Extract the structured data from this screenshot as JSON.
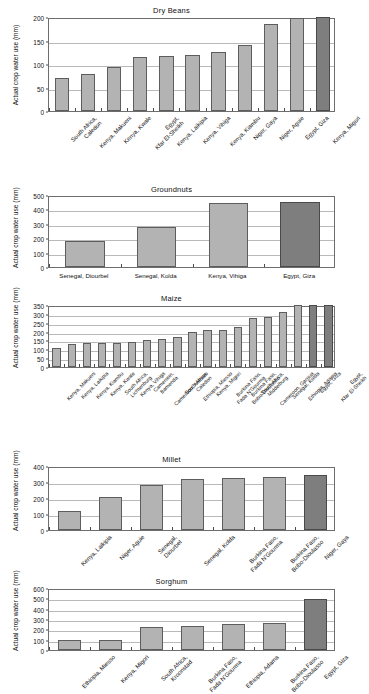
{
  "figure": {
    "ylabel": "Actual crop water use (mm)",
    "colors": {
      "bar": "#b3b3b3",
      "bar_highlight": "#7e7e7e",
      "axis": "#6d6d6d",
      "grid": "#b9b9b9"
    }
  },
  "chart_data": [
    {
      "type": "bar",
      "title": "Dry Beans",
      "xlabel": "",
      "ylabel": "Actual crop water use (mm)",
      "ylim": [
        0,
        200
      ],
      "yticks": [
        0,
        50,
        100,
        150,
        200
      ],
      "grid": true,
      "legend": "none",
      "categories": [
        "South Africa, Caledon",
        "Kenya, Makueni",
        "Kenya, Kwale",
        "Egypt, Kfar El-Sheikh",
        "Kenya, Laikipia",
        "Kenya, Vihiga",
        "Kenya, Kiambu",
        "Niger, Gaya",
        "Niger, Aguie",
        "Egypt, Giza",
        "Kenya, Migori"
      ],
      "values": [
        70,
        79,
        94,
        114,
        117,
        119,
        126,
        140,
        186,
        198,
        200
      ],
      "highlighted": [
        10
      ]
    },
    {
      "type": "bar",
      "title": "Groundnuts",
      "xlabel": "",
      "ylabel": "Actual crop water use (mm)",
      "ylim": [
        0,
        500
      ],
      "yticks": [
        0,
        100,
        200,
        300,
        400,
        500
      ],
      "grid": true,
      "legend": "none",
      "categories": [
        "Senegal, Diourbel",
        "Senegal, Kolda",
        "Kenya, Vihiga",
        "Egypt, Giza"
      ],
      "values": [
        180,
        281,
        444,
        451
      ],
      "highlighted": [
        3
      ]
    },
    {
      "type": "bar",
      "title": "Maize",
      "xlabel": "",
      "ylabel": "Actual crop water use (mm)",
      "ylim": [
        0,
        350
      ],
      "yticks": [
        0,
        50,
        100,
        150,
        200,
        250,
        300,
        350
      ],
      "grid": true,
      "legend": "none",
      "categories": [
        "Kenya, Makueni",
        "Kenya, Laikipia",
        "Kenya, Kiambu",
        "Kenya, Kwale",
        "South Africa, Lichtenburg",
        "Kenya, Vihiga",
        "Cameroon, Bamenda",
        "Cameroon, Ambam",
        "South Africa, Caledon",
        "Ethiopia, Miesso",
        "Kenya, Migori",
        "Burkina Faso, Fada N'Gourma",
        "Burkina Faso, Bobo-Dioulasso",
        "South Africa, Middelburg",
        "Cameroon, Garoua",
        "Senegal, Kolda",
        "Ethiopia, Adama",
        "Egypt, Giza",
        "Egypt, Kfar El-Sheikh"
      ],
      "values": [
        110,
        130,
        134,
        136,
        137,
        139,
        152,
        157,
        167,
        197,
        211,
        211,
        228,
        276,
        285,
        310,
        350,
        350,
        350
      ],
      "highlighted": [
        17,
        18
      ]
    },
    {
      "type": "bar",
      "title": "Millet",
      "xlabel": "",
      "ylabel": "Actual crop water use (mm)",
      "ylim": [
        0,
        400
      ],
      "yticks": [
        0,
        100,
        200,
        300,
        400
      ],
      "grid": true,
      "legend": "none",
      "categories": [
        "Kenya, Laikipia",
        "Niger, Aguie",
        "Senegal, Diourbel",
        "Senegal, Kolda",
        "Burkina Faso, Fada N'Gourma",
        "Burkina Faso, Bobo-Dioulasso",
        "Niger, Gaya"
      ],
      "values": [
        118,
        208,
        282,
        318,
        325,
        330,
        345
      ],
      "highlighted": [
        6
      ]
    },
    {
      "type": "bar",
      "title": "Sorghum",
      "xlabel": "",
      "ylabel": "Actual crop water use (mm)",
      "ylim": [
        0,
        600
      ],
      "yticks": [
        0,
        100,
        200,
        300,
        400,
        500,
        600
      ],
      "grid": true,
      "legend": "none",
      "categories": [
        "Ethiopia, Miesso",
        "Kenya, Migori",
        "South Africa, Kroonstad",
        "Burkina Faso, Fada N'Gourma",
        "Ethiopia, Adama",
        "Burkina Faso, Bobo-Dioulasso",
        "Egypt, Giza"
      ],
      "values": [
        95,
        93,
        218,
        228,
        255,
        258,
        498
      ],
      "highlighted": [
        6
      ]
    }
  ]
}
